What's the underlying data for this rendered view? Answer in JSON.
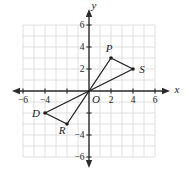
{
  "figure": {
    "x_axis_label": "x",
    "y_axis_label": "y",
    "origin_label": "O",
    "background_color": "#ffffff",
    "grid_color": "#d8d8d8",
    "axis_color": "#2b2b2b",
    "line_color": "#1f1f1f",
    "text_color": "#1c1c1c"
  },
  "chart_data": {
    "type": "scatter",
    "title": "",
    "xlabel": "x",
    "ylabel": "y",
    "xlim": [
      -6,
      6
    ],
    "ylim": [
      -6,
      6
    ],
    "grid": true,
    "grid_step": 1,
    "tick_values_x": [
      -6,
      -4,
      -2,
      2,
      4,
      6
    ],
    "tick_values_y": [
      -6,
      -4,
      -2,
      2,
      4,
      6
    ],
    "x_tick_labels": [
      -6,
      -4,
      2,
      4,
      6
    ],
    "y_tick_labels": [
      6,
      4,
      2,
      -4,
      -6
    ],
    "points": [
      {
        "name": "O",
        "x": 0,
        "y": 0,
        "dot": false,
        "label_dx": 7,
        "label_dy": 12
      },
      {
        "name": "P",
        "x": 2,
        "y": 3,
        "dot": true,
        "label_dx": -2,
        "label_dy": -6
      },
      {
        "name": "S",
        "x": 4,
        "y": 2,
        "dot": true,
        "label_dx": 9,
        "label_dy": 4
      },
      {
        "name": "D",
        "x": -4,
        "y": -2,
        "dot": true,
        "label_dx": -9,
        "label_dy": 4
      },
      {
        "name": "R",
        "x": -2,
        "y": -3,
        "dot": true,
        "label_dx": -5,
        "label_dy": 10
      }
    ],
    "segments": [
      [
        "O",
        "P"
      ],
      [
        "O",
        "S"
      ],
      [
        "P",
        "S"
      ],
      [
        "O",
        "D"
      ],
      [
        "O",
        "R"
      ],
      [
        "D",
        "R"
      ]
    ],
    "shapes": [
      "triangle OPS",
      "triangle ODR"
    ]
  }
}
